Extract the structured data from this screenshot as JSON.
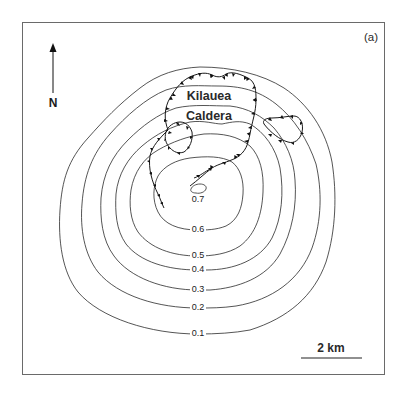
{
  "figure": {
    "panel_label": "(a)",
    "north_label": "N",
    "scale_bar_label": "2 km",
    "place_labels": {
      "line1": "Kilauea",
      "line2": "Caldera"
    }
  },
  "contours": [
    {
      "value": "0.1"
    },
    {
      "value": "0.2"
    },
    {
      "value": "0.3"
    },
    {
      "value": "0.4"
    },
    {
      "value": "0.5"
    },
    {
      "value": "0.6"
    },
    {
      "value": "0.7"
    }
  ],
  "features": [
    {
      "name": "Kilauea Caldera rim (hachured fault scarp)"
    },
    {
      "name": "Western pit crater (hachured)"
    },
    {
      "name": "Eastern pit crater (hachured)"
    },
    {
      "name": "Southwest rift fault (hachured)"
    },
    {
      "name": "Southeast rift fault (hachured)"
    }
  ]
}
